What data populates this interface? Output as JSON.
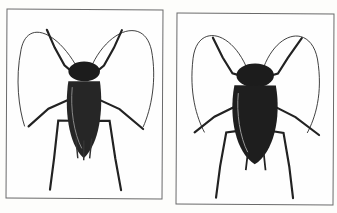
{
  "figure": {
    "panels": [
      {
        "id": "left",
        "subject": "cockroach-dorsal-view-winged",
        "description": "Cockroach illustration, dorsal view, long antennae curving outward"
      },
      {
        "id": "right",
        "subject": "cockroach-dorsal-view-wingless",
        "description": "Cockroach illustration, dorsal view, broader body, long antennae curving outward"
      }
    ],
    "caption_fragment": "",
    "colors": {
      "ink": "#1a1a1a",
      "paper": "#fdfdfb",
      "frame": "#6a6a6a"
    }
  }
}
